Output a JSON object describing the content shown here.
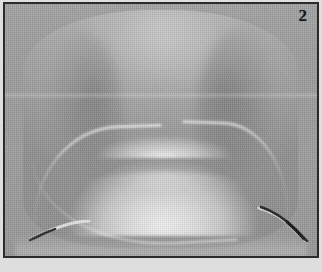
{
  "figure": {
    "panel_label": "2",
    "caption": "",
    "image_kind": "grayscale-photograph",
    "frame": {
      "border_color": "#2b2b2b",
      "border_width_px": 2,
      "background_color": "#9a9a9a",
      "paper_color": "#dedede"
    },
    "palette": {
      "background_gray": "#9a9a9a",
      "specimen_mid_gray": "#aeaeae",
      "specimen_light_gray": "#c2c2c2",
      "highlight_white": "#f2f2f2",
      "shadow_gray": "#8f8f8f",
      "probe_dark": "#1d1d1d",
      "label_color": "#181818"
    },
    "regions": [
      {
        "name": "specimen-body",
        "description": "broad rounded tissue mass filling the frame"
      },
      {
        "name": "bright-arch",
        "description": "bright dome-shaped structure across the centre"
      },
      {
        "name": "left-ridge",
        "description": "bright ridge sweeping down to the lower left"
      },
      {
        "name": "right-ridge",
        "description": "bright ridge sweeping down to the lower right"
      },
      {
        "name": "lower-mass",
        "description": "darker tissue below the arch"
      },
      {
        "name": "probe-left",
        "description": "thin dark instrument tip at lower left"
      },
      {
        "name": "probe-right",
        "description": "thin dark curved instrument at lower right"
      },
      {
        "name": "scan-band",
        "description": "faint horizontal scan line across the middle"
      }
    ]
  }
}
